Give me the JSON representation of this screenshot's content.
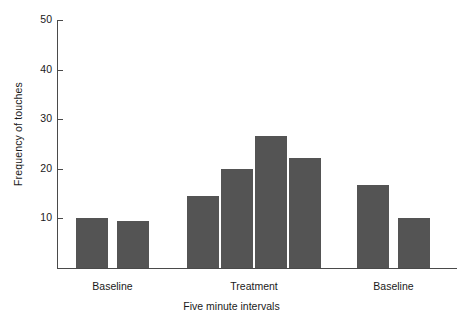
{
  "chart_data": {
    "type": "bar",
    "title": "",
    "xlabel": "Five minute intervals",
    "ylabel": "Frequency of touches",
    "ylim": [
      0,
      50
    ],
    "yticks": [
      10,
      20,
      30,
      40,
      50
    ],
    "ytick_labels": [
      "10",
      "20",
      "30",
      "40",
      "50"
    ],
    "grid": false,
    "legend": null,
    "categories": [
      "1",
      "2",
      "3",
      "4",
      "5",
      "6",
      "7",
      "8"
    ],
    "values": [
      10,
      9.4,
      14.4,
      20,
      26.6,
      22.1,
      16.7,
      10
    ],
    "bar_color": "#545454",
    "axis_color": "#4a4a4a",
    "background": "#ffffff",
    "phases": [
      {
        "label": "Baseline",
        "bar_indices": [
          0,
          1
        ]
      },
      {
        "label": "Treatment",
        "bar_indices": [
          2,
          3,
          4,
          5
        ]
      },
      {
        "label": "Baseline",
        "bar_indices": [
          6,
          7
        ]
      }
    ]
  },
  "axis": {
    "y_label": "Frequency of touches",
    "x_label": "Five minute intervals",
    "ticks": [
      {
        "value": "50"
      },
      {
        "value": "40"
      },
      {
        "value": "30"
      },
      {
        "value": "20"
      },
      {
        "value": "10"
      }
    ]
  },
  "phase_labels": [
    {
      "text": "Baseline"
    },
    {
      "text": "Treatment"
    },
    {
      "text": "Baseline"
    }
  ]
}
